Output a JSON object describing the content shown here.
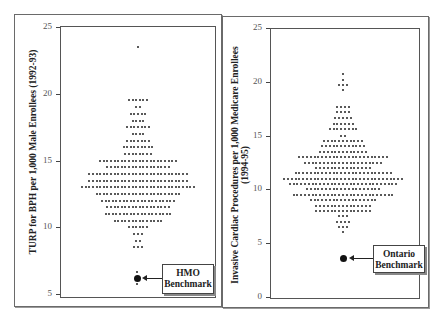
{
  "chart_data": [
    {
      "type": "scatter",
      "subtype": "dot-plot",
      "title": "",
      "ylabel": "TURP for BPH per 1,000 Male Enrollees (1992-93)",
      "xlabel": "",
      "ylim": [
        5,
        25
      ],
      "yticks": [
        "25",
        "20",
        "15",
        "10",
        "5"
      ],
      "rows": [
        {
          "y": 23.5,
          "count": 1
        },
        {
          "y": 19.5,
          "count": 6
        },
        {
          "y": 19.0,
          "count": 2
        },
        {
          "y": 18.5,
          "count": 5
        },
        {
          "y": 18.0,
          "count": 4
        },
        {
          "y": 17.5,
          "count": 7
        },
        {
          "y": 17.0,
          "count": 4
        },
        {
          "y": 16.5,
          "count": 7
        },
        {
          "y": 16.0,
          "count": 9
        },
        {
          "y": 15.5,
          "count": 8
        },
        {
          "y": 15.0,
          "count": 22
        },
        {
          "y": 14.5,
          "count": 18
        },
        {
          "y": 14.0,
          "count": 28
        },
        {
          "y": 13.5,
          "count": 28
        },
        {
          "y": 13.0,
          "count": 32
        },
        {
          "y": 12.5,
          "count": 24
        },
        {
          "y": 12.0,
          "count": 21
        },
        {
          "y": 11.5,
          "count": 18
        },
        {
          "y": 11.0,
          "count": 19
        },
        {
          "y": 10.5,
          "count": 14
        },
        {
          "y": 10.0,
          "count": 6
        },
        {
          "y": 9.5,
          "count": 3
        },
        {
          "y": 9.0,
          "count": 2
        },
        {
          "y": 8.5,
          "count": 3
        }
      ],
      "benchmark": {
        "label_line1": "HMO",
        "label_line2": "Benchmark",
        "y": 6.2
      }
    },
    {
      "type": "scatter",
      "subtype": "dot-plot",
      "title": "",
      "ylabel": "Invasive Cardiac Procedures per 1,000 Medicare Enrollees",
      "ylabel_line2": "(1994-95)",
      "xlabel": "",
      "ylim": [
        0,
        25
      ],
      "yticks": [
        "25",
        "20",
        "15",
        "10",
        "5",
        "0"
      ],
      "rows": [
        {
          "y": 20.7,
          "count": 1
        },
        {
          "y": 20.2,
          "count": 1
        },
        {
          "y": 19.7,
          "count": 3
        },
        {
          "y": 19.2,
          "count": 1
        },
        {
          "y": 17.7,
          "count": 4
        },
        {
          "y": 17.2,
          "count": 4
        },
        {
          "y": 16.6,
          "count": 5
        },
        {
          "y": 16.1,
          "count": 6
        },
        {
          "y": 15.6,
          "count": 8
        },
        {
          "y": 15.0,
          "count": 2
        },
        {
          "y": 14.5,
          "count": 11
        },
        {
          "y": 14.0,
          "count": 12
        },
        {
          "y": 13.5,
          "count": 13
        },
        {
          "y": 13.0,
          "count": 24
        },
        {
          "y": 12.5,
          "count": 21
        },
        {
          "y": 12.0,
          "count": 15
        },
        {
          "y": 11.5,
          "count": 26
        },
        {
          "y": 11.0,
          "count": 32
        },
        {
          "y": 10.5,
          "count": 29
        },
        {
          "y": 10.0,
          "count": 20
        },
        {
          "y": 9.5,
          "count": 27
        },
        {
          "y": 9.0,
          "count": 18
        },
        {
          "y": 8.5,
          "count": 15
        },
        {
          "y": 8.0,
          "count": 15
        },
        {
          "y": 7.5,
          "count": 3
        },
        {
          "y": 7.0,
          "count": 4
        },
        {
          "y": 6.5,
          "count": 3
        },
        {
          "y": 6.0,
          "count": 1
        }
      ],
      "benchmark": {
        "label_line1": "Ontario",
        "label_line2": "Benchmark",
        "y": 3.4
      }
    }
  ]
}
